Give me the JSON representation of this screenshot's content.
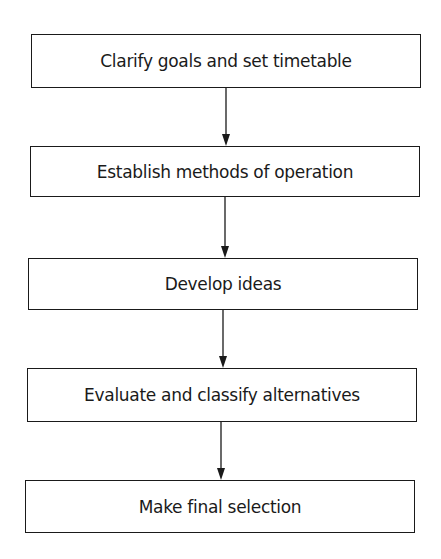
{
  "diagram": {
    "type": "flowchart",
    "direction": "top-to-bottom",
    "steps": [
      {
        "label": "Clarify goals and set timetable",
        "x": 31,
        "y": 34,
        "w": 390,
        "h": 54
      },
      {
        "label": "Establish methods of operation",
        "x": 30,
        "y": 146,
        "w": 390,
        "h": 51
      },
      {
        "label": "Develop ideas",
        "x": 28,
        "y": 258,
        "w": 390,
        "h": 52
      },
      {
        "label": "Evaluate and classify alternatives",
        "x": 27,
        "y": 368,
        "w": 390,
        "h": 54
      },
      {
        "label": "Make final selection",
        "x": 25,
        "y": 480,
        "w": 390,
        "h": 53
      }
    ],
    "arrows": [
      {
        "x": 226,
        "y1": 88,
        "y2": 146
      },
      {
        "x": 225,
        "y1": 197,
        "y2": 258
      },
      {
        "x": 223,
        "y1": 310,
        "y2": 368
      },
      {
        "x": 221,
        "y1": 422,
        "y2": 480
      }
    ],
    "colors": {
      "stroke": "#1a1a1a",
      "fill": "#ffffff"
    }
  }
}
